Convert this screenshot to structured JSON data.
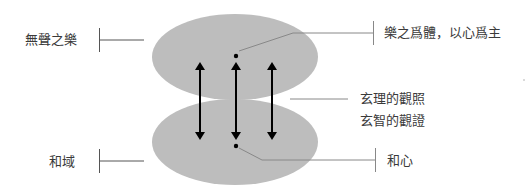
{
  "diagram": {
    "left_labels": {
      "top": "無聲之樂",
      "bottom": "和域"
    },
    "right_labels": {
      "top": "樂之爲體，以心爲主",
      "middle_line1": "玄理的觀照",
      "middle_line2": "玄智的觀證",
      "bottom": "和心"
    },
    "colors": {
      "ellipse_fill": "#bdbdbd",
      "arrow": "#000000",
      "leader_line": "#888888"
    }
  }
}
